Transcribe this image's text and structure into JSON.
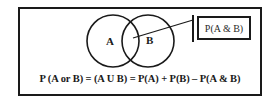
{
  "diagram": {
    "colors": {
      "stroke": "#1a1a1a",
      "background": "#ffffff",
      "text": "#1a1a1a"
    },
    "sets": [
      {
        "label": "A",
        "cx": 113,
        "cy": 41,
        "r": 26
      },
      {
        "label": "B",
        "cx": 148,
        "cy": 41,
        "r": 26
      }
    ],
    "intersection_callout": {
      "label": "P(A & B)",
      "pointer_from": {
        "x": 133,
        "y": 38
      },
      "pointer_to": {
        "x": 193,
        "y": 20
      },
      "bar": {
        "x": 193,
        "y1": 15,
        "y2": 42
      }
    },
    "formula": "P (A or B) = (A U B) = P(A) + P(B) – P(A & B)"
  }
}
